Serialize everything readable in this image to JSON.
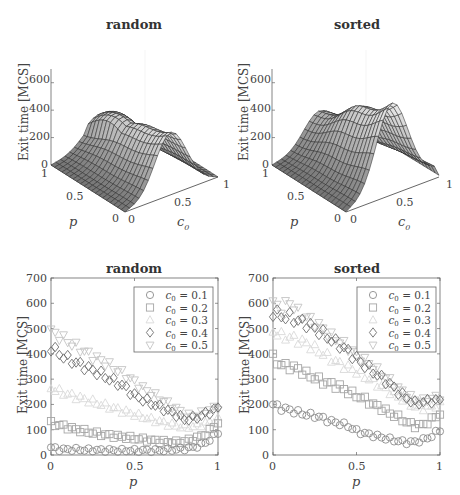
{
  "figure": {
    "panels": [
      {
        "id": "surface-random",
        "title": "random",
        "zlabel": "Exit time [MCS]",
        "xlabel": "c0",
        "ylabel": "p",
        "zticks": [
          "0",
          "200",
          "400",
          "600"
        ],
        "xticks": [
          "0",
          "0.5",
          "1"
        ],
        "yticks": [
          "0",
          "0.5",
          "1"
        ]
      },
      {
        "id": "surface-sorted",
        "title": "sorted",
        "zlabel": "Exit time [MCS]",
        "xlabel": "c0",
        "ylabel": "p",
        "zticks": [
          "0",
          "200",
          "400",
          "600"
        ],
        "xticks": [
          "0",
          "0.5",
          "1"
        ],
        "yticks": [
          "0",
          "0.5",
          "1"
        ]
      },
      {
        "id": "scatter-random",
        "title": "random",
        "ylabel": "Exit time [MCS]",
        "xlabel": "p",
        "yticks": [
          "0",
          "100",
          "200",
          "300",
          "400",
          "500",
          "600",
          "700"
        ],
        "xticks": [
          "0",
          "0.5",
          "1"
        ]
      },
      {
        "id": "scatter-sorted",
        "title": "sorted",
        "ylabel": "Exit time [MCS]",
        "xlabel": "p",
        "yticks": [
          "0",
          "100",
          "200",
          "300",
          "400",
          "500",
          "600",
          "700"
        ],
        "xticks": [
          "0",
          "0.5",
          "1"
        ]
      }
    ],
    "legend": [
      "c0 = 0.1",
      "c0 = 0.2",
      "c0 = 0.3",
      "c0 = 0.4",
      "c0 = 0.5"
    ],
    "colors": {
      "c0_0.1": "#8c8c8c",
      "c0_0.2": "#a6a6a6",
      "c0_0.3": "#d9d9d9",
      "c0_0.4": "#6e6e6e",
      "c0_0.5": "#c4c4c4",
      "surface_light": "#e6e6e6",
      "surface_dark": "#8a8a8a",
      "mesh": "#333333"
    }
  },
  "chart_data": [
    {
      "type": "surface",
      "title": "random",
      "xlabel": "c0",
      "ylabel": "p",
      "zlabel": "Exit time [MCS]",
      "xlim": [
        0,
        1
      ],
      "ylim": [
        0,
        1
      ],
      "zlim": [
        0,
        700
      ],
      "description": "Exit time vs c0 and p; ridge near c0=0.5 peaking ~450 at p=0, lower (~200) near p=1"
    },
    {
      "type": "surface",
      "title": "sorted",
      "xlabel": "c0",
      "ylabel": "p",
      "zlabel": "Exit time [MCS]",
      "xlim": [
        0,
        1
      ],
      "ylim": [
        0,
        1
      ],
      "zlim": [
        0,
        700
      ],
      "description": "Exit time vs c0 and p; ridge near c0=0.5 peaking ~600 at p=0, ~230 near p=1"
    },
    {
      "type": "scatter",
      "title": "random",
      "xlabel": "p",
      "ylabel": "Exit time [MCS]",
      "xlim": [
        0,
        1
      ],
      "ylim": [
        0,
        700
      ],
      "x": [
        0,
        0.05,
        0.1,
        0.15,
        0.2,
        0.25,
        0.3,
        0.35,
        0.4,
        0.45,
        0.5,
        0.55,
        0.6,
        0.65,
        0.7,
        0.75,
        0.8,
        0.85,
        0.9,
        0.95,
        1.0
      ],
      "series": [
        {
          "name": "c0 = 0.1",
          "marker": "circle",
          "values": [
            30,
            22,
            22,
            22,
            20,
            20,
            19,
            19,
            18,
            18,
            18,
            18,
            18,
            18,
            20,
            22,
            25,
            30,
            40,
            60,
            90
          ]
        },
        {
          "name": "c0 = 0.2",
          "marker": "square",
          "values": [
            125,
            118,
            110,
            100,
            95,
            88,
            82,
            78,
            74,
            70,
            66,
            62,
            58,
            55,
            52,
            50,
            55,
            62,
            75,
            95,
            130
          ]
        },
        {
          "name": "c0 = 0.3",
          "marker": "triangle-up",
          "values": [
            265,
            250,
            240,
            230,
            220,
            210,
            200,
            190,
            180,
            170,
            160,
            150,
            140,
            132,
            122,
            115,
            110,
            112,
            120,
            130,
            140
          ]
        },
        {
          "name": "c0 = 0.4",
          "marker": "diamond",
          "values": [
            425,
            400,
            380,
            365,
            350,
            335,
            320,
            300,
            285,
            265,
            235,
            220,
            205,
            190,
            175,
            160,
            140,
            145,
            155,
            170,
            185
          ]
        },
        {
          "name": "c0 = 0.5",
          "marker": "triangle-down",
          "values": [
            490,
            470,
            450,
            430,
            410,
            390,
            375,
            355,
            335,
            315,
            290,
            265,
            245,
            225,
            205,
            185,
            160,
            155,
            165,
            180,
            190
          ]
        }
      ]
    },
    {
      "type": "scatter",
      "title": "sorted",
      "xlabel": "p",
      "ylabel": "Exit time [MCS]",
      "xlim": [
        0,
        1
      ],
      "ylim": [
        0,
        700
      ],
      "x": [
        0,
        0.05,
        0.1,
        0.15,
        0.2,
        0.25,
        0.3,
        0.35,
        0.4,
        0.45,
        0.5,
        0.55,
        0.6,
        0.65,
        0.7,
        0.75,
        0.8,
        0.85,
        0.9,
        0.95,
        1.0
      ],
      "series": [
        {
          "name": "c0 = 0.1",
          "marker": "circle",
          "values": [
            200,
            185,
            178,
            168,
            160,
            155,
            145,
            132,
            125,
            115,
            95,
            85,
            78,
            70,
            62,
            55,
            50,
            52,
            60,
            75,
            100
          ]
        },
        {
          "name": "c0 = 0.2",
          "marker": "square",
          "values": [
            385,
            355,
            350,
            340,
            320,
            305,
            290,
            280,
            270,
            250,
            235,
            220,
            200,
            185,
            165,
            150,
            130,
            115,
            120,
            140,
            165
          ]
        },
        {
          "name": "c0 = 0.3",
          "marker": "triangle-up",
          "values": [
            490,
            470,
            465,
            455,
            440,
            420,
            400,
            380,
            360,
            345,
            330,
            310,
            290,
            270,
            250,
            230,
            210,
            190,
            185,
            190,
            200
          ]
        },
        {
          "name": "c0 = 0.4",
          "marker": "diamond",
          "values": [
            565,
            550,
            545,
            530,
            520,
            500,
            480,
            455,
            435,
            410,
            380,
            355,
            330,
            305,
            280,
            250,
            225,
            205,
            210,
            215,
            215
          ]
        },
        {
          "name": "c0 = 0.5",
          "marker": "triangle-down",
          "values": [
            600,
            580,
            605,
            565,
            545,
            525,
            500,
            470,
            450,
            425,
            400,
            375,
            350,
            320,
            295,
            265,
            240,
            220,
            215,
            225,
            230
          ]
        }
      ]
    }
  ]
}
